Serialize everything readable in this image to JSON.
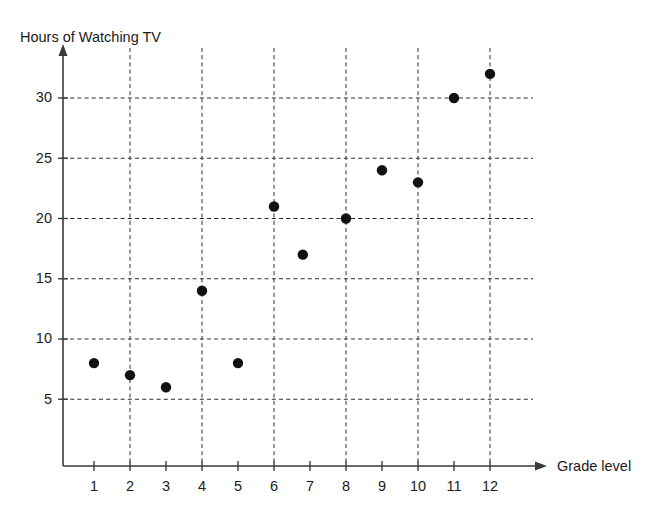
{
  "chart_data": {
    "type": "scatter",
    "title": "",
    "xlabel": "Grade level",
    "ylabel": "Hours of Watching TV",
    "xlim": [
      0,
      13
    ],
    "ylim": [
      0,
      34
    ],
    "grid": true,
    "legend": null,
    "x_ticks": [
      1,
      2,
      3,
      4,
      5,
      6,
      7,
      8,
      9,
      10,
      11,
      12
    ],
    "x_tick_labels": [
      "1",
      "2",
      "3",
      "4",
      "5",
      "6",
      "7",
      "8",
      "9",
      "10",
      "11",
      "12"
    ],
    "y_ticks": [
      5,
      10,
      15,
      20,
      25,
      30
    ],
    "y_tick_labels": [
      "5",
      "10",
      "15",
      "20",
      "25",
      "30"
    ],
    "x_gridlines": [
      2,
      4,
      6,
      8,
      10,
      12
    ],
    "y_gridlines": [
      5,
      10,
      15,
      20,
      25,
      30
    ],
    "points": [
      {
        "x": 1,
        "y": 8
      },
      {
        "x": 2,
        "y": 7
      },
      {
        "x": 3,
        "y": 6
      },
      {
        "x": 4,
        "y": 14
      },
      {
        "x": 5,
        "y": 8
      },
      {
        "x": 6,
        "y": 21
      },
      {
        "x": 6.8,
        "y": 17
      },
      {
        "x": 8,
        "y": 20
      },
      {
        "x": 9,
        "y": 24
      },
      {
        "x": 10,
        "y": 23
      },
      {
        "x": 11,
        "y": 30
      },
      {
        "x": 12,
        "y": 32
      }
    ],
    "marker": {
      "shape": "circle",
      "color": "#111111",
      "size": 5.2
    },
    "colors": {
      "axis": "#3b3b3b",
      "grid": "#2c2c2c",
      "text": "#1a1a1a",
      "background": "#ffffff"
    }
  }
}
